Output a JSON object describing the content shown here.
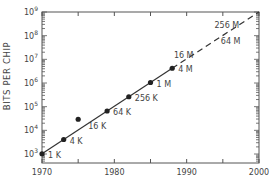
{
  "chart_data": {
    "type": "line",
    "title": "",
    "xlabel": "",
    "ylabel": "BITS PER CHIP",
    "xscale": "linear",
    "yscale": "log",
    "xlim": [
      1970,
      2000
    ],
    "ylim": [
      1000,
      1000000000
    ],
    "x_ticks": [
      1970,
      1980,
      1990,
      2000
    ],
    "x_tick_labels": [
      "1970",
      "1980",
      "1990",
      "2000"
    ],
    "y_ticks": [
      1000,
      10000,
      100000,
      1000000,
      10000000,
      100000000,
      1000000000
    ],
    "y_tick_labels": [
      {
        "base": "10",
        "exp": "3"
      },
      {
        "base": "10",
        "exp": "4"
      },
      {
        "base": "10",
        "exp": "5"
      },
      {
        "base": "10",
        "exp": "6"
      },
      {
        "base": "10",
        "exp": "7"
      },
      {
        "base": "10",
        "exp": "8"
      },
      {
        "base": "10",
        "exp": "9"
      }
    ],
    "grid": false,
    "legend": null,
    "series": [
      {
        "name": "Actual",
        "style": "solid",
        "marker": "dot",
        "points": [
          {
            "x": 1970,
            "y": 1024,
            "label": "1K"
          },
          {
            "x": 1973,
            "y": 4096,
            "label": "4K"
          },
          {
            "x": 1975,
            "y": 16384,
            "label": "16K"
          },
          {
            "x": 1979,
            "y": 65536,
            "label": "64K"
          },
          {
            "x": 1982,
            "y": 262144,
            "label": "256K"
          },
          {
            "x": 1985,
            "y": 1048576,
            "label": "1M"
          },
          {
            "x": 1988,
            "y": 4194304,
            "label": "4M"
          }
        ]
      },
      {
        "name": "Projected",
        "style": "dashed",
        "marker": "none",
        "points": [
          {
            "x": 1988,
            "y": 4194304,
            "label": ""
          },
          {
            "x": 1991,
            "y": 16777216,
            "label": "16 M"
          },
          {
            "x": 1995,
            "y": 67108864,
            "label": "64 M"
          },
          {
            "x": 1998,
            "y": 268435456,
            "label": "256 M"
          },
          {
            "x": 2000,
            "y": 1000000000,
            "label": ""
          }
        ]
      }
    ]
  }
}
